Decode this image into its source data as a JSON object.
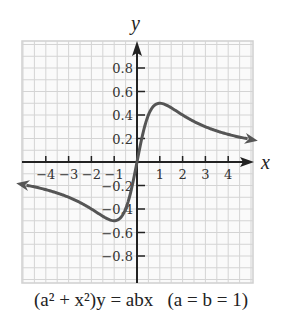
{
  "chart_data": {
    "type": "line",
    "title": "",
    "equation": "(a² + x²)y = abx",
    "parameters": "(a = b = 1)",
    "function": "y = x / (1 + x^2)",
    "xlabel": "x",
    "ylabel": "y",
    "xlim": [
      -5,
      5
    ],
    "ylim": [
      -1,
      1
    ],
    "grid": true,
    "x_ticks": [
      -4,
      -3,
      -2,
      -1,
      1,
      2,
      3,
      4
    ],
    "x_tick_labels": [
      "−4",
      "−3",
      "−2",
      "−1",
      "1",
      "2",
      "3",
      "4"
    ],
    "y_ticks": [
      0.8,
      0.6,
      0.4,
      0.2,
      -0.2,
      -0.4,
      -0.6,
      -0.8
    ],
    "y_tick_labels": [
      "0.8",
      "0.6",
      "0.4",
      "0.2",
      "−0.2",
      "−0.4",
      "−0.6",
      "−0.8"
    ],
    "series": [
      {
        "name": "y = x/(1+x²)",
        "x": [
          -5,
          -4,
          -3,
          -2,
          -1,
          -0.5,
          0,
          0.5,
          1,
          2,
          3,
          4,
          5
        ],
        "y": [
          -0.19,
          -0.24,
          -0.3,
          -0.4,
          -0.5,
          -0.4,
          0,
          0.4,
          0.5,
          0.4,
          0.3,
          0.24,
          0.19
        ]
      }
    ],
    "annotations": [
      "max at (1, 0.5)",
      "min at (-1, -0.5)",
      "arrows at both ends"
    ]
  },
  "labels": {
    "x_axis": "x",
    "y_axis": "y"
  },
  "caption": {
    "equation": "(a² + x²)y = abx",
    "params": "(a = b = 1)"
  }
}
